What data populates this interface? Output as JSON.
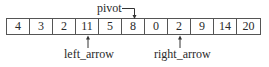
{
  "diagram": {
    "array_values": [
      "4",
      "3",
      "2",
      "11",
      "5",
      "8",
      "0",
      "2",
      "9",
      "14",
      "20"
    ],
    "pivot_label": "pivot",
    "pivot_index": 5,
    "left_arrow_label": "left_arrow",
    "left_arrow_index": 3,
    "right_arrow_label": "right_arrow",
    "right_arrow_index": 7
  }
}
